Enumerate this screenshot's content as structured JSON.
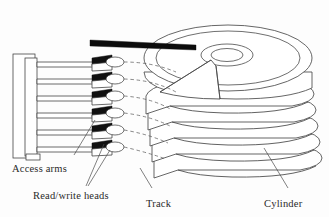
{
  "figure": {
    "background_color": "#fdfdfd",
    "line_color": "#3a3a3a",
    "accent_color": "#111111",
    "width": 329,
    "height": 217
  },
  "labels": {
    "access_arms": "Access arms",
    "read_write_heads": "Read/write heads",
    "track": "Track",
    "cylinder": "Cylinder"
  },
  "components": {
    "platter_count": 6,
    "arm_count": 6,
    "head_count": 6,
    "spindle_hole": "center-hub",
    "cutaway_wedge": "pie-slice-removed"
  },
  "leaders": {
    "access_arms_target": "actuator-arm-assembly",
    "read_write_heads_target": "head-sliders",
    "track_target": "platter-surface-circle",
    "cylinder_target": "aligned-track-stack"
  }
}
